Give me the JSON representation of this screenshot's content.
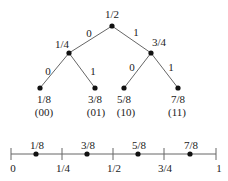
{
  "tree": {
    "root": {
      "label": "1/2"
    },
    "level1": [
      {
        "label": "1/4",
        "edge_label": "0"
      },
      {
        "label": "3/4",
        "edge_label": "1"
      }
    ],
    "leaves": [
      {
        "label": "1/8",
        "code": "(00)",
        "edge_label": "0"
      },
      {
        "label": "3/8",
        "code": "(01)",
        "edge_label": "1"
      },
      {
        "label": "5/8",
        "code": "(10)",
        "edge_label": "0"
      },
      {
        "label": "7/8",
        "code": "(11)",
        "edge_label": "1"
      }
    ]
  },
  "number_line": {
    "ticks": [
      "0",
      "1/4",
      "1/2",
      "3/4",
      "1"
    ],
    "points": [
      "1/8",
      "3/8",
      "5/8",
      "7/8"
    ]
  },
  "colors": {
    "line": "#666666",
    "dot": "#111111",
    "text": "#222222"
  }
}
